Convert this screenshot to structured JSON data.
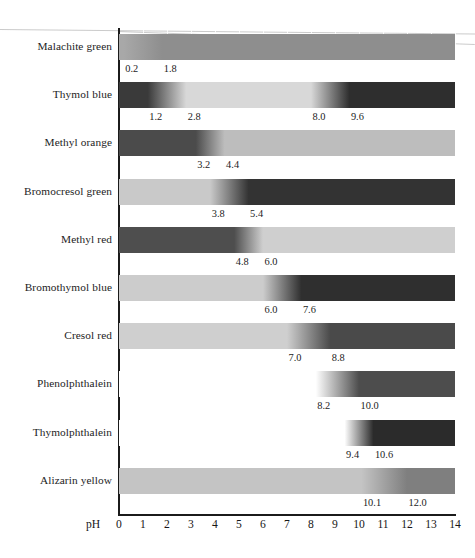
{
  "figure": {
    "axis_title": "pH",
    "x_min": 0,
    "x_max": 14,
    "tick_labels": [
      "0",
      "1",
      "2",
      "3",
      "4",
      "5",
      "6",
      "7",
      "8",
      "9",
      "10",
      "11",
      "12",
      "13",
      "14"
    ],
    "note": "Grayscale reproduction of acid-base indicator colour-change ranges"
  },
  "chart_data": {
    "type": "bar",
    "title": "",
    "subtitle": "",
    "xlabel": "pH",
    "ylabel": "",
    "xlim": [
      0,
      14
    ],
    "grid": true,
    "legend_position": "none",
    "categories": [
      "Malachite green",
      "Thymol blue",
      "Methyl orange",
      "Bromocresol green",
      "Methyl red",
      "Bromothymol blue",
      "Cresol red",
      "Phenolphthalein",
      "Thymolphthalein",
      "Alizarin yellow"
    ],
    "series": [
      {
        "name": "transition_low",
        "values": [
          0.2,
          1.2,
          3.2,
          3.8,
          4.8,
          6.0,
          7.0,
          8.2,
          9.4,
          10.1
        ]
      },
      {
        "name": "transition_high",
        "values": [
          1.8,
          2.8,
          4.4,
          5.4,
          6.0,
          7.6,
          8.8,
          10.0,
          10.6,
          12.0
        ]
      }
    ],
    "indicators": [
      {
        "name": "Malachite green",
        "low_label": "0.2",
        "high_label": "1.8",
        "low": 0.2,
        "high": 1.8,
        "acid_gray": "#a8a8a8",
        "base_gray": "#8e8e8e",
        "second_range": null
      },
      {
        "name": "Thymol blue",
        "low_label": "1.2",
        "high_label": "2.8",
        "low": 1.2,
        "high": 2.8,
        "acid_gray": "#3a3a3a",
        "base_gray": "#d8d8d8",
        "second_range": {
          "low_label": "8.0",
          "high_label": "9.6",
          "low": 8.0,
          "high": 9.6,
          "gray": "#2e2e2e"
        }
      },
      {
        "name": "Methyl orange",
        "low_label": "3.2",
        "high_label": "4.4",
        "low": 3.2,
        "high": 4.4,
        "acid_gray": "#4b4b4b",
        "base_gray": "#bdbdbd",
        "second_range": null
      },
      {
        "name": "Bromocresol green",
        "low_label": "3.8",
        "high_label": "5.4",
        "low": 3.8,
        "high": 5.4,
        "acid_gray": "#c9c9c9",
        "base_gray": "#333333",
        "second_range": null
      },
      {
        "name": "Methyl red",
        "low_label": "4.8",
        "high_label": "6.0",
        "low": 4.8,
        "high": 6.0,
        "acid_gray": "#4e4e4e",
        "base_gray": "#cfcfcf",
        "second_range": null
      },
      {
        "name": "Bromothymol blue",
        "low_label": "6.0",
        "high_label": "7.6",
        "low": 6.0,
        "high": 7.6,
        "acid_gray": "#cccccc",
        "base_gray": "#2f2f2f",
        "second_range": null
      },
      {
        "name": "Cresol red",
        "low_label": "7.0",
        "high_label": "8.8",
        "low": 7.0,
        "high": 8.8,
        "acid_gray": "#cfcfcf",
        "base_gray": "#4a4a4a",
        "second_range": null
      },
      {
        "name": "Phenolphthalein",
        "low_label": "8.2",
        "high_label": "10.0",
        "low": 8.2,
        "high": 10.0,
        "acid_gray": "#ffffff",
        "base_gray": "#4d4d4d",
        "second_range": null
      },
      {
        "name": "Thymolphthalein",
        "low_label": "9.4",
        "high_label": "10.6",
        "low": 9.4,
        "high": 10.6,
        "acid_gray": "#ffffff",
        "base_gray": "#2b2b2b",
        "second_range": null
      },
      {
        "name": "Alizarin yellow",
        "low_label": "10.1",
        "high_label": "12.0",
        "low": 10.1,
        "high": 12.0,
        "acid_gray": "#c4c4c4",
        "base_gray": "#7f7f7f",
        "second_range": null
      }
    ]
  }
}
